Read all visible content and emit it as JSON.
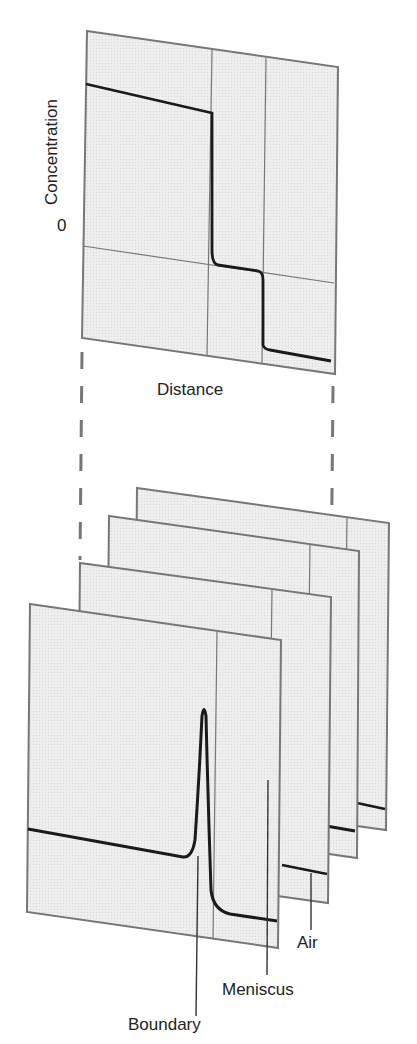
{
  "top_plot": {
    "y_axis_label": "Concentration",
    "zero_label": "0",
    "x_axis_label": "Distance"
  },
  "bottom_stack": {
    "panel_count": 4,
    "labels": {
      "air": "Air",
      "meniscus": "Meniscus",
      "boundary": "Boundary"
    }
  },
  "colors": {
    "panel_fill": "#ededed",
    "panel_border": "#777777",
    "curve": "#1a1a1a",
    "text": "#222222"
  }
}
